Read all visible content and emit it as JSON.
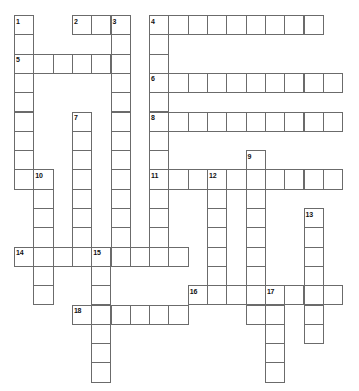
{
  "puzzle": {
    "type": "crossword-grid",
    "title": "",
    "grid": {
      "columns": 17,
      "rows": 19,
      "cell_size": 19.3,
      "origin_x": 14,
      "origin_y": 15,
      "cell_fill": "#ffffff",
      "cell_border": "#6b6b6b",
      "background": "#ffffff",
      "number_color": "#111111"
    },
    "entries": [
      {
        "number": "1",
        "direction": "down",
        "row": 0,
        "col": 0,
        "length": 12
      },
      {
        "number": "2",
        "direction": "across",
        "row": 0,
        "col": 3,
        "length": 3
      },
      {
        "number": "3",
        "direction": "down",
        "row": 0,
        "col": 5,
        "length": 13
      },
      {
        "number": "4",
        "direction": "across",
        "row": 0,
        "col": 7,
        "length": 9
      },
      {
        "number": "4",
        "direction": "down",
        "row": 0,
        "col": 7,
        "length": 16
      },
      {
        "number": "5",
        "direction": "across",
        "row": 2,
        "col": 0,
        "length": 6
      },
      {
        "number": "6",
        "direction": "across",
        "row": 3,
        "col": 7,
        "length": 10
      },
      {
        "number": "7",
        "direction": "down",
        "row": 5,
        "col": 3,
        "length": 10
      },
      {
        "number": "8",
        "direction": "across",
        "row": 5,
        "col": 7,
        "length": 10
      },
      {
        "number": "9",
        "direction": "down",
        "row": 7,
        "col": 12,
        "length": 9
      },
      {
        "number": "10",
        "direction": "down",
        "row": 8,
        "col": 1,
        "length": 8
      },
      {
        "number": "11",
        "direction": "across",
        "row": 8,
        "col": 7,
        "length": 10
      },
      {
        "number": "12",
        "direction": "down",
        "row": 8,
        "col": 10,
        "length": 8
      },
      {
        "number": "13",
        "direction": "down",
        "row": 10,
        "col": 15,
        "length": 8
      },
      {
        "number": "14",
        "direction": "across",
        "row": 12,
        "col": 0,
        "length": 9
      },
      {
        "number": "15",
        "direction": "down",
        "row": 12,
        "col": 4,
        "length": 7
      },
      {
        "number": "16",
        "direction": "across",
        "row": 14,
        "col": 9,
        "length": 8
      },
      {
        "number": "17",
        "direction": "down",
        "row": 14,
        "col": 13,
        "length": 5
      },
      {
        "number": "18",
        "direction": "across",
        "row": 15,
        "col": 3,
        "length": 6
      }
    ],
    "cells": [
      {
        "r": 0,
        "c": 0,
        "n": "1"
      },
      {
        "r": 0,
        "c": 3,
        "n": "2"
      },
      {
        "r": 0,
        "c": 4,
        "n": ""
      },
      {
        "r": 0,
        "c": 5,
        "n": "3"
      },
      {
        "r": 0,
        "c": 7,
        "n": "4"
      },
      {
        "r": 0,
        "c": 8,
        "n": ""
      },
      {
        "r": 0,
        "c": 9,
        "n": ""
      },
      {
        "r": 0,
        "c": 10,
        "n": ""
      },
      {
        "r": 0,
        "c": 11,
        "n": ""
      },
      {
        "r": 0,
        "c": 12,
        "n": ""
      },
      {
        "r": 0,
        "c": 13,
        "n": ""
      },
      {
        "r": 0,
        "c": 14,
        "n": ""
      },
      {
        "r": 0,
        "c": 15,
        "n": ""
      },
      {
        "r": 1,
        "c": 0,
        "n": ""
      },
      {
        "r": 1,
        "c": 5,
        "n": ""
      },
      {
        "r": 1,
        "c": 7,
        "n": ""
      },
      {
        "r": 2,
        "c": 0,
        "n": "5"
      },
      {
        "r": 2,
        "c": 1,
        "n": ""
      },
      {
        "r": 2,
        "c": 2,
        "n": ""
      },
      {
        "r": 2,
        "c": 3,
        "n": ""
      },
      {
        "r": 2,
        "c": 4,
        "n": ""
      },
      {
        "r": 2,
        "c": 5,
        "n": ""
      },
      {
        "r": 2,
        "c": 7,
        "n": ""
      },
      {
        "r": 3,
        "c": 0,
        "n": ""
      },
      {
        "r": 3,
        "c": 5,
        "n": ""
      },
      {
        "r": 3,
        "c": 7,
        "n": "6"
      },
      {
        "r": 3,
        "c": 8,
        "n": ""
      },
      {
        "r": 3,
        "c": 9,
        "n": ""
      },
      {
        "r": 3,
        "c": 10,
        "n": ""
      },
      {
        "r": 3,
        "c": 11,
        "n": ""
      },
      {
        "r": 3,
        "c": 12,
        "n": ""
      },
      {
        "r": 3,
        "c": 13,
        "n": ""
      },
      {
        "r": 3,
        "c": 14,
        "n": ""
      },
      {
        "r": 3,
        "c": 15,
        "n": ""
      },
      {
        "r": 3,
        "c": 16,
        "n": ""
      },
      {
        "r": 4,
        "c": 0,
        "n": ""
      },
      {
        "r": 4,
        "c": 5,
        "n": ""
      },
      {
        "r": 4,
        "c": 7,
        "n": ""
      },
      {
        "r": 5,
        "c": 0,
        "n": ""
      },
      {
        "r": 5,
        "c": 3,
        "n": "7"
      },
      {
        "r": 5,
        "c": 5,
        "n": ""
      },
      {
        "r": 5,
        "c": 7,
        "n": "8"
      },
      {
        "r": 5,
        "c": 8,
        "n": ""
      },
      {
        "r": 5,
        "c": 9,
        "n": ""
      },
      {
        "r": 5,
        "c": 10,
        "n": ""
      },
      {
        "r": 5,
        "c": 11,
        "n": ""
      },
      {
        "r": 5,
        "c": 12,
        "n": ""
      },
      {
        "r": 5,
        "c": 13,
        "n": ""
      },
      {
        "r": 5,
        "c": 14,
        "n": ""
      },
      {
        "r": 5,
        "c": 15,
        "n": ""
      },
      {
        "r": 5,
        "c": 16,
        "n": ""
      },
      {
        "r": 6,
        "c": 0,
        "n": ""
      },
      {
        "r": 6,
        "c": 3,
        "n": ""
      },
      {
        "r": 6,
        "c": 5,
        "n": ""
      },
      {
        "r": 6,
        "c": 7,
        "n": ""
      },
      {
        "r": 7,
        "c": 0,
        "n": ""
      },
      {
        "r": 7,
        "c": 3,
        "n": ""
      },
      {
        "r": 7,
        "c": 5,
        "n": ""
      },
      {
        "r": 7,
        "c": 7,
        "n": ""
      },
      {
        "r": 7,
        "c": 12,
        "n": "9"
      },
      {
        "r": 8,
        "c": 0,
        "n": ""
      },
      {
        "r": 8,
        "c": 1,
        "n": "10"
      },
      {
        "r": 8,
        "c": 3,
        "n": ""
      },
      {
        "r": 8,
        "c": 5,
        "n": ""
      },
      {
        "r": 8,
        "c": 7,
        "n": "11"
      },
      {
        "r": 8,
        "c": 8,
        "n": ""
      },
      {
        "r": 8,
        "c": 9,
        "n": ""
      },
      {
        "r": 8,
        "c": 10,
        "n": "12"
      },
      {
        "r": 8,
        "c": 11,
        "n": ""
      },
      {
        "r": 8,
        "c": 12,
        "n": ""
      },
      {
        "r": 8,
        "c": 13,
        "n": ""
      },
      {
        "r": 8,
        "c": 14,
        "n": ""
      },
      {
        "r": 8,
        "c": 15,
        "n": ""
      },
      {
        "r": 8,
        "c": 16,
        "n": ""
      },
      {
        "r": 9,
        "c": 1,
        "n": ""
      },
      {
        "r": 9,
        "c": 3,
        "n": ""
      },
      {
        "r": 9,
        "c": 5,
        "n": ""
      },
      {
        "r": 9,
        "c": 7,
        "n": ""
      },
      {
        "r": 9,
        "c": 10,
        "n": ""
      },
      {
        "r": 9,
        "c": 12,
        "n": ""
      },
      {
        "r": 10,
        "c": 1,
        "n": ""
      },
      {
        "r": 10,
        "c": 3,
        "n": ""
      },
      {
        "r": 10,
        "c": 5,
        "n": ""
      },
      {
        "r": 10,
        "c": 7,
        "n": ""
      },
      {
        "r": 10,
        "c": 10,
        "n": ""
      },
      {
        "r": 10,
        "c": 12,
        "n": ""
      },
      {
        "r": 10,
        "c": 15,
        "n": "13"
      },
      {
        "r": 11,
        "c": 1,
        "n": ""
      },
      {
        "r": 11,
        "c": 3,
        "n": ""
      },
      {
        "r": 11,
        "c": 5,
        "n": ""
      },
      {
        "r": 11,
        "c": 7,
        "n": ""
      },
      {
        "r": 11,
        "c": 10,
        "n": ""
      },
      {
        "r": 11,
        "c": 12,
        "n": ""
      },
      {
        "r": 11,
        "c": 15,
        "n": ""
      },
      {
        "r": 12,
        "c": 0,
        "n": "14"
      },
      {
        "r": 12,
        "c": 1,
        "n": ""
      },
      {
        "r": 12,
        "c": 2,
        "n": ""
      },
      {
        "r": 12,
        "c": 3,
        "n": ""
      },
      {
        "r": 12,
        "c": 4,
        "n": "15"
      },
      {
        "r": 12,
        "c": 5,
        "n": ""
      },
      {
        "r": 12,
        "c": 6,
        "n": ""
      },
      {
        "r": 12,
        "c": 7,
        "n": ""
      },
      {
        "r": 12,
        "c": 8,
        "n": ""
      },
      {
        "r": 12,
        "c": 10,
        "n": ""
      },
      {
        "r": 12,
        "c": 12,
        "n": ""
      },
      {
        "r": 12,
        "c": 15,
        "n": ""
      },
      {
        "r": 13,
        "c": 1,
        "n": ""
      },
      {
        "r": 13,
        "c": 4,
        "n": ""
      },
      {
        "r": 13,
        "c": 10,
        "n": ""
      },
      {
        "r": 13,
        "c": 12,
        "n": ""
      },
      {
        "r": 13,
        "c": 15,
        "n": ""
      },
      {
        "r": 14,
        "c": 1,
        "n": ""
      },
      {
        "r": 14,
        "c": 4,
        "n": ""
      },
      {
        "r": 14,
        "c": 9,
        "n": "16"
      },
      {
        "r": 14,
        "c": 10,
        "n": ""
      },
      {
        "r": 14,
        "c": 11,
        "n": ""
      },
      {
        "r": 14,
        "c": 12,
        "n": ""
      },
      {
        "r": 14,
        "c": 13,
        "n": "17"
      },
      {
        "r": 14,
        "c": 14,
        "n": ""
      },
      {
        "r": 14,
        "c": 15,
        "n": ""
      },
      {
        "r": 14,
        "c": 16,
        "n": ""
      },
      {
        "r": 15,
        "c": 3,
        "n": "18"
      },
      {
        "r": 15,
        "c": 4,
        "n": ""
      },
      {
        "r": 15,
        "c": 5,
        "n": ""
      },
      {
        "r": 15,
        "c": 6,
        "n": ""
      },
      {
        "r": 15,
        "c": 7,
        "n": ""
      },
      {
        "r": 15,
        "c": 8,
        "n": ""
      },
      {
        "r": 15,
        "c": 12,
        "n": ""
      },
      {
        "r": 15,
        "c": 13,
        "n": ""
      },
      {
        "r": 15,
        "c": 15,
        "n": ""
      },
      {
        "r": 16,
        "c": 4,
        "n": ""
      },
      {
        "r": 16,
        "c": 13,
        "n": ""
      },
      {
        "r": 16,
        "c": 15,
        "n": ""
      },
      {
        "r": 17,
        "c": 4,
        "n": ""
      },
      {
        "r": 17,
        "c": 13,
        "n": ""
      },
      {
        "r": 18,
        "c": 4,
        "n": ""
      },
      {
        "r": 18,
        "c": 13,
        "n": ""
      }
    ]
  }
}
